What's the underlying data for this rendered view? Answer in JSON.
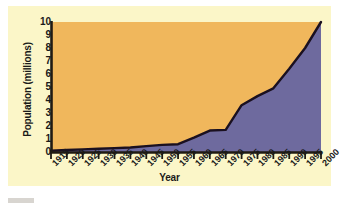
{
  "figure": {
    "panel_bg": "#fbf6c8",
    "page_bg": "#ffffff",
    "footer_bar_color": "#d8d5d0"
  },
  "chart_data": {
    "type": "area",
    "title": "",
    "xlabel": "Year",
    "ylabel": "Population (millions)",
    "x": [
      1915,
      1920,
      1925,
      1930,
      1935,
      1940,
      1945,
      1950,
      1955,
      1960,
      1965,
      1970,
      1975,
      1980,
      1985,
      1990,
      1995,
      2000
    ],
    "values": [
      0.1,
      0.15,
      0.2,
      0.25,
      0.3,
      0.35,
      0.45,
      0.55,
      0.6,
      1.1,
      1.65,
      1.7,
      3.6,
      4.3,
      4.9,
      6.4,
      8.0,
      10.0
    ],
    "categories": [
      "1915",
      "1920",
      "1925",
      "1930",
      "1935",
      "1940",
      "1945",
      "1950",
      "1955",
      "1960",
      "1965",
      "1970",
      "1975",
      "1980",
      "1985",
      "1990",
      "1995",
      "2000"
    ],
    "yticks": [
      0,
      1,
      2,
      3,
      4,
      5,
      6,
      7,
      8,
      9,
      10
    ],
    "ytick_labels": [
      "0",
      "1",
      "2",
      "3",
      "4",
      "5",
      "6",
      "7",
      "8",
      "9",
      "10"
    ],
    "xlim": [
      1915,
      2000
    ],
    "ylim": [
      0,
      10
    ],
    "grid": false,
    "legend": false,
    "area_fill_color": "#6e6a9e",
    "above_fill_color": "#f0b75c",
    "line_color": "#1a1020",
    "axis_color": "#201a12"
  }
}
